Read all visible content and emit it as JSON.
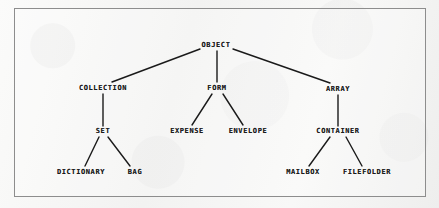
{
  "diagram": {
    "frame": {
      "x": 14,
      "y": 8,
      "width": 412,
      "height": 189,
      "border_color": "#8d8d8d"
    },
    "background_color": "#f7f7f6",
    "ink_color": "#1a1a1a",
    "nodes": [
      {
        "id": "object",
        "label": "OBJECT",
        "x": 216,
        "y": 45,
        "level": 0
      },
      {
        "id": "collection",
        "label": "COLLECTION",
        "x": 103,
        "y": 88,
        "level": 1
      },
      {
        "id": "form",
        "label": "FORM",
        "x": 217,
        "y": 88,
        "level": 1
      },
      {
        "id": "array",
        "label": "ARRAY",
        "x": 338,
        "y": 89,
        "level": 1
      },
      {
        "id": "set",
        "label": "SET",
        "x": 103,
        "y": 131,
        "level": 2
      },
      {
        "id": "expense",
        "label": "EXPENSE",
        "x": 187,
        "y": 131,
        "level": 2
      },
      {
        "id": "envelope",
        "label": "ENVELOPE",
        "x": 248,
        "y": 131,
        "level": 2
      },
      {
        "id": "container",
        "label": "CONTAINER",
        "x": 338,
        "y": 131,
        "level": 2
      },
      {
        "id": "dictionary",
        "label": "DICTIONARY",
        "x": 81,
        "y": 172,
        "level": 3
      },
      {
        "id": "bag",
        "label": "BAG",
        "x": 135,
        "y": 172,
        "level": 3
      },
      {
        "id": "mailbox",
        "label": "MAILBOX",
        "x": 303,
        "y": 172,
        "level": 3
      },
      {
        "id": "filefolder",
        "label": "FILEFOLDER",
        "x": 367,
        "y": 172,
        "level": 3
      }
    ],
    "edges": [
      {
        "from": "object",
        "to": "collection",
        "x1": 200,
        "y1": 49,
        "x2": 112,
        "y2": 82
      },
      {
        "from": "object",
        "to": "form",
        "x1": 217,
        "y1": 51,
        "x2": 217,
        "y2": 82
      },
      {
        "from": "object",
        "to": "array",
        "x1": 233,
        "y1": 49,
        "x2": 330,
        "y2": 83
      },
      {
        "from": "collection",
        "to": "set",
        "x1": 103,
        "y1": 94,
        "x2": 103,
        "y2": 126
      },
      {
        "from": "form",
        "to": "expense",
        "x1": 212,
        "y1": 94,
        "x2": 192,
        "y2": 125
      },
      {
        "from": "form",
        "to": "envelope",
        "x1": 223,
        "y1": 94,
        "x2": 243,
        "y2": 125
      },
      {
        "from": "array",
        "to": "container",
        "x1": 338,
        "y1": 95,
        "x2": 338,
        "y2": 126
      },
      {
        "from": "set",
        "to": "dictionary",
        "x1": 99,
        "y1": 137,
        "x2": 85,
        "y2": 166
      },
      {
        "from": "set",
        "to": "bag",
        "x1": 108,
        "y1": 137,
        "x2": 130,
        "y2": 166
      },
      {
        "from": "container",
        "to": "mailbox",
        "x1": 330,
        "y1": 137,
        "x2": 309,
        "y2": 166
      },
      {
        "from": "container",
        "to": "filefolder",
        "x1": 346,
        "y1": 137,
        "x2": 362,
        "y2": 166
      }
    ]
  }
}
